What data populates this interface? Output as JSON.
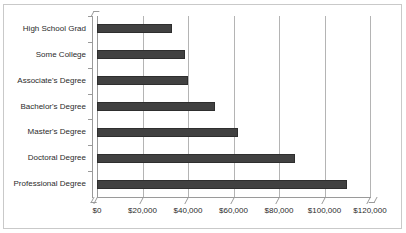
{
  "chart_data": {
    "type": "bar",
    "orientation": "horizontal",
    "title": "",
    "subtitle": "",
    "xlabel": "",
    "ylabel": "",
    "categories": [
      "High School Grad",
      "Some College",
      "Associate's Degree",
      "Bachelor's Degree",
      "Master's Degree",
      "Doctoral Degree",
      "Professional Degree"
    ],
    "values": [
      33000,
      38500,
      40000,
      52000,
      62000,
      87000,
      110000
    ],
    "xlim": [
      0,
      120000
    ],
    "x_tick_labels": [
      "$0",
      "$20,000",
      "$40,000",
      "$60,000",
      "$80,000",
      "$100,000",
      "$120,000"
    ],
    "x_tick_values": [
      0,
      20000,
      40000,
      60000,
      80000,
      100000,
      120000
    ],
    "grid": true,
    "grid_axis": "x",
    "legend": false,
    "legend_position": "none",
    "bar_color": "#414141",
    "grid_color": "#b4b4b4",
    "axis_color": "#9a9a9a",
    "border_color": "#c9c9c9",
    "background_color": "#ffffff",
    "text_color": "#2b2b2b"
  }
}
